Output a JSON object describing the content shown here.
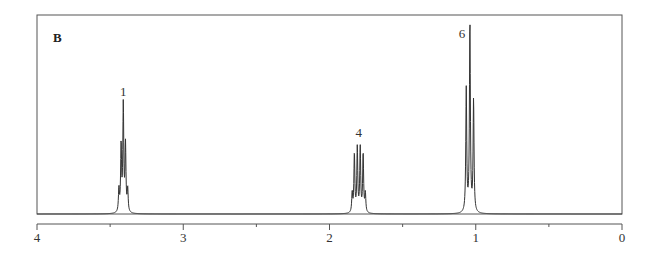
{
  "chart_data": {
    "type": "line",
    "title": "",
    "panel_label": "B",
    "xlabel": "",
    "ylabel": "",
    "x_axis": {
      "reversed": true,
      "range": [
        4,
        0
      ],
      "major_ticks": [
        4,
        3,
        2,
        1,
        0
      ],
      "major_tick_labels": [
        "4",
        "3",
        "2",
        "1",
        "0"
      ],
      "minor_ticks": [
        3.5,
        2.5,
        1.5,
        0.5
      ],
      "unit": "ppm"
    },
    "grid": false,
    "legend": null,
    "peaks": [
      {
        "label": "1",
        "multiplicity": "quintet",
        "center_ppm": 3.41,
        "lines_ppm": [
          3.44,
          3.425,
          3.41,
          3.395,
          3.38
        ],
        "relative_heights": [
          0.12,
          0.35,
          0.56,
          0.35,
          0.12
        ]
      },
      {
        "label": "4",
        "multiplicity": "sextet",
        "center_ppm": 1.8,
        "lines_ppm": [
          1.845,
          1.83,
          1.81,
          1.79,
          1.77,
          1.755
        ],
        "relative_heights": [
          0.1,
          0.31,
          0.34,
          0.34,
          0.31,
          0.1
        ]
      },
      {
        "label": "6",
        "multiplicity": "triplet",
        "center_ppm": 1.04,
        "lines_ppm": [
          1.065,
          1.04,
          1.015
        ],
        "relative_heights": [
          0.65,
          1.0,
          0.59
        ]
      }
    ]
  }
}
